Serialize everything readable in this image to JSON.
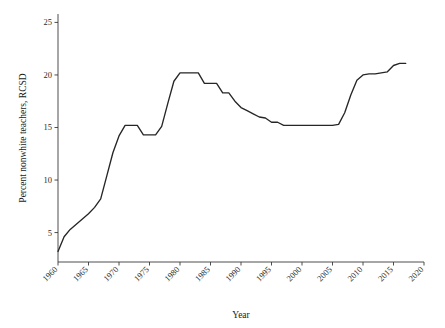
{
  "chart_data": {
    "type": "line",
    "title": "",
    "subtitle": "",
    "xlabel": "Year",
    "ylabel": "Percent nonwhite teachers, RCSD",
    "xlim": [
      1960,
      2020
    ],
    "ylim": [
      2.2,
      25.8
    ],
    "xticks": [
      1960,
      1965,
      1970,
      1975,
      1980,
      1985,
      1990,
      1995,
      2000,
      2005,
      2010,
      2015,
      2020
    ],
    "xticklabels": [
      "1960",
      "1965",
      "1970",
      "1975",
      "1980",
      "1985",
      "1990",
      "1995",
      "2000",
      "2005",
      "2010",
      "2015",
      "2020"
    ],
    "yticks": [
      5,
      10,
      15,
      20,
      25
    ],
    "yticklabels": [
      "5",
      "10",
      "15",
      "20",
      "25"
    ],
    "grid": false,
    "legend": false,
    "legend_position": "none",
    "line_color": "#262626",
    "series": [
      {
        "name": "Percent nonwhite teachers, RCSD",
        "x": [
          1960,
          1961,
          1962,
          1963,
          1964,
          1965,
          1966,
          1967,
          1968,
          1969,
          1970,
          1971,
          1972,
          1973,
          1974,
          1975,
          1976,
          1977,
          1978,
          1979,
          1980,
          1981,
          1982,
          1983,
          1984,
          1985,
          1986,
          1987,
          1988,
          1989,
          1990,
          1991,
          1992,
          1993,
          1994,
          1995,
          1996,
          1997,
          1998,
          1999,
          2000,
          2001,
          2002,
          2003,
          2004,
          2005,
          2006,
          2007,
          2008,
          2009,
          2010,
          2011,
          2012,
          2013,
          2014,
          2015,
          2016,
          2017
        ],
        "values": [
          3.2,
          4.6,
          5.3,
          5.8,
          6.3,
          6.8,
          7.4,
          8.2,
          10.4,
          12.6,
          14.2,
          15.2,
          15.2,
          15.2,
          14.3,
          14.3,
          14.3,
          15.1,
          17.3,
          19.4,
          20.2,
          20.2,
          20.2,
          20.2,
          19.2,
          19.2,
          19.2,
          18.3,
          18.3,
          17.5,
          16.9,
          16.6,
          16.3,
          16.0,
          15.9,
          15.5,
          15.5,
          15.2,
          15.2,
          15.2,
          15.2,
          15.2,
          15.2,
          15.2,
          15.2,
          15.2,
          15.3,
          16.4,
          18.1,
          19.5,
          20.0,
          20.1,
          20.1,
          20.2,
          20.3,
          20.9,
          21.1,
          21.1
        ]
      }
    ]
  }
}
